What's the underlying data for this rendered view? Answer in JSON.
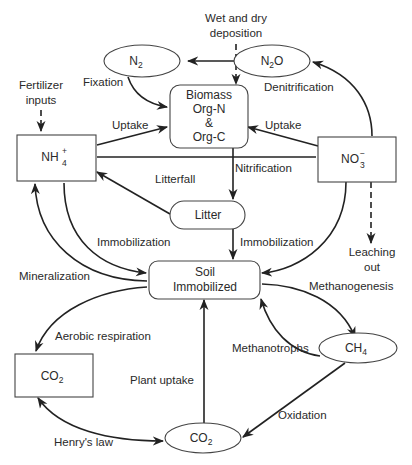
{
  "diagram": {
    "nodes": {
      "n2": {
        "label": "N",
        "sub": "2"
      },
      "n2o": {
        "label": "N",
        "sub": "2",
        "suffix": "O"
      },
      "biomass": {
        "line1": "Biomass",
        "line2": "Org-N",
        "line3": "&",
        "line4": "Org-C"
      },
      "nh4": {
        "label": "NH",
        "sup": "+",
        "sub": "4"
      },
      "no3": {
        "label": "NO",
        "sup": "−",
        "sub": "3"
      },
      "litter": {
        "label": "Litter"
      },
      "soil": {
        "line1": "Soil",
        "line2": "Immobilized"
      },
      "co2_box": {
        "label": "CO",
        "sub": "2"
      },
      "ch4": {
        "label": "CH",
        "sub": "4"
      },
      "co2_ellipse": {
        "label": "CO",
        "sub": "2"
      }
    },
    "edge_labels": {
      "deposition_1": "Wet and dry",
      "deposition_2": "deposition",
      "fixation": "Fixation",
      "denitrification": "Denitrification",
      "fertilizer_1": "Fertilizer",
      "fertilizer_2": "inputs",
      "uptake_left": "Uptake",
      "uptake_right": "Uptake",
      "nitrification": "Nitrification",
      "litterfall": "Litterfall",
      "immobilization_left": "Immobilization",
      "immobilization_right": "Immobilization",
      "leaching_1": "Leaching",
      "leaching_2": "out",
      "mineralization": "Mineralization",
      "methanogenesis": "Methanogenesis",
      "aerobic_respiration": "Aerobic respiration",
      "methanotrophs": "Methanotrophs",
      "plant_uptake": "Plant uptake",
      "oxidation": "Oxidation",
      "henrys_law": "Henry's law"
    },
    "colors": {
      "line": "#222222",
      "text": "#2a2a2a",
      "background": "#ffffff"
    }
  }
}
